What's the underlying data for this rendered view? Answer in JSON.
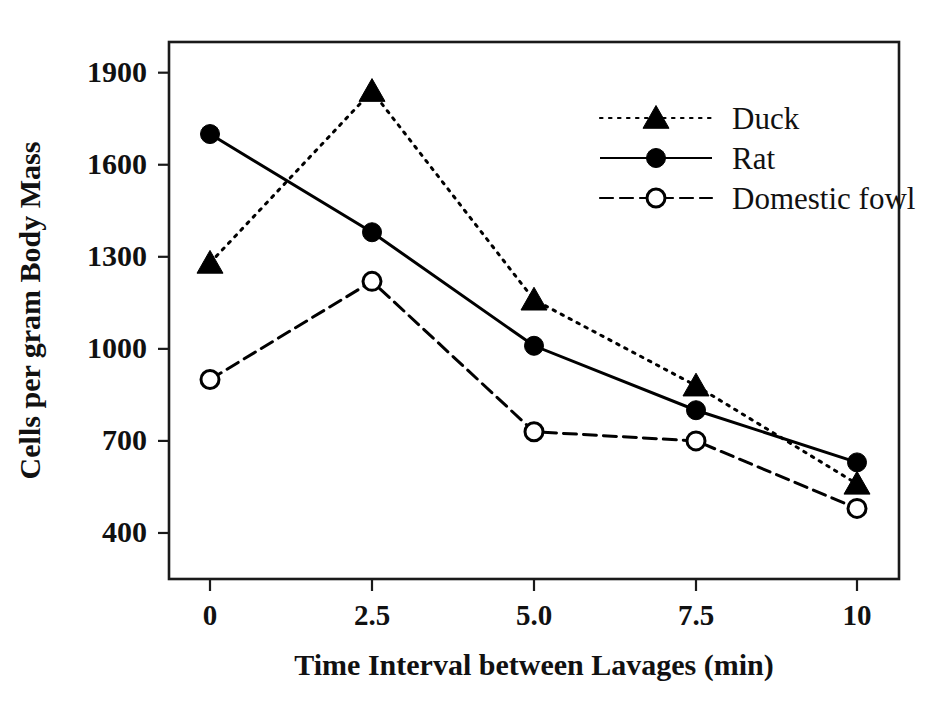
{
  "chart_data": {
    "type": "line",
    "title": "",
    "xlabel": "Time Interval between Lavages (min)",
    "ylabel": "Cells per gram Body Mass",
    "x": [
      0,
      2.5,
      5.0,
      7.5,
      10
    ],
    "xtick_labels": [
      "0",
      "2.5",
      "5.0",
      "7.5",
      "10"
    ],
    "ytick_labels": [
      "1900",
      "1600",
      "1300",
      "1000",
      "700",
      "400"
    ],
    "yticks": [
      1900,
      1600,
      1300,
      1000,
      700,
      400
    ],
    "xlim": [
      0,
      10
    ],
    "ylim": [
      250,
      2000
    ],
    "grid": false,
    "legend_position": "top-right",
    "series": [
      {
        "name": "Duck",
        "marker": "filled-triangle",
        "linestyle": "dotted",
        "color": "#000000",
        "values": [
          1280,
          1840,
          1160,
          880,
          560
        ]
      },
      {
        "name": "Rat",
        "marker": "filled-circle",
        "linestyle": "solid",
        "color": "#000000",
        "values": [
          1700,
          1380,
          1010,
          800,
          630
        ]
      },
      {
        "name": "Domestic fowl",
        "marker": "open-circle",
        "linestyle": "dashed",
        "color": "#000000",
        "values": [
          900,
          1220,
          730,
          700,
          480
        ]
      }
    ]
  },
  "legend": {
    "entries": [
      "Duck",
      "Rat",
      "Domestic fowl"
    ]
  },
  "colors": {
    "ink": "#111111",
    "axis": "#1a1a1a",
    "background": "#ffffff"
  }
}
